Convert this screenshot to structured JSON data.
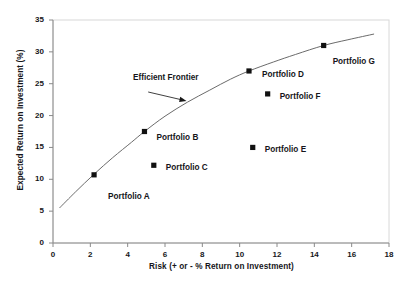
{
  "chart_data": {
    "type": "scatter",
    "title": "",
    "xlabel": "Risk (+ or - % Return on Investment)",
    "ylabel": "Expected Return on Investment (%)",
    "xlim": [
      0,
      18
    ],
    "ylim": [
      0,
      35
    ],
    "xticks": [
      0,
      2,
      4,
      6,
      8,
      10,
      12,
      14,
      16,
      18
    ],
    "yticks": [
      0,
      5,
      10,
      15,
      20,
      25,
      30,
      35
    ],
    "xtick_labels": [
      "0",
      "2",
      "4",
      "6",
      "8",
      "10",
      "12",
      "14",
      "16",
      "18"
    ],
    "ytick_labels": [
      "0",
      "5",
      "10",
      "15",
      "20",
      "25",
      "30",
      "35"
    ],
    "grid": false,
    "legend": "none",
    "marker_color": "#111111",
    "line_color": "#6b6b6b",
    "points": [
      {
        "label": "Portfolio A",
        "x": 2.2,
        "y": 10.7,
        "label_dx": 14,
        "label_dy": 22
      },
      {
        "label": "Portfolio B",
        "x": 4.9,
        "y": 17.5,
        "label_dx": 12,
        "label_dy": 6
      },
      {
        "label": "Portfolio C",
        "x": 5.4,
        "y": 12.2,
        "label_dx": 12,
        "label_dy": 3
      },
      {
        "label": "Portfolio D",
        "x": 10.5,
        "y": 27.0,
        "label_dx": 13,
        "label_dy": 4
      },
      {
        "label": "Portfolio E",
        "x": 10.7,
        "y": 15.0,
        "label_dx": 12,
        "label_dy": 3
      },
      {
        "label": "Portfolio F",
        "x": 11.5,
        "y": 23.4,
        "label_dx": 12,
        "label_dy": 3
      },
      {
        "label": "Portfolio G",
        "x": 14.5,
        "y": 31.0,
        "label_dx": 9,
        "label_dy": 17
      }
    ],
    "frontier_curve": {
      "name": "Efficient Frontier",
      "points": [
        {
          "x": 0.35,
          "y": 5.5
        },
        {
          "x": 1.2,
          "y": 8.0
        },
        {
          "x": 2.2,
          "y": 10.8
        },
        {
          "x": 3.2,
          "y": 13.4
        },
        {
          "x": 4.2,
          "y": 15.8
        },
        {
          "x": 4.9,
          "y": 17.5
        },
        {
          "x": 6.0,
          "y": 19.9
        },
        {
          "x": 7.2,
          "y": 22.1
        },
        {
          "x": 8.4,
          "y": 24.0
        },
        {
          "x": 9.5,
          "y": 25.7
        },
        {
          "x": 10.5,
          "y": 27.0
        },
        {
          "x": 11.8,
          "y": 28.4
        },
        {
          "x": 13.0,
          "y": 29.6
        },
        {
          "x": 14.5,
          "y": 31.0
        },
        {
          "x": 15.8,
          "y": 31.9
        },
        {
          "x": 17.2,
          "y": 32.8
        }
      ]
    },
    "annotation": {
      "text": "Efficient Frontier",
      "arrow_from": {
        "x": 5.1,
        "y": 23.7
      },
      "arrow_to": {
        "x": 7.15,
        "y": 22.3
      }
    }
  }
}
